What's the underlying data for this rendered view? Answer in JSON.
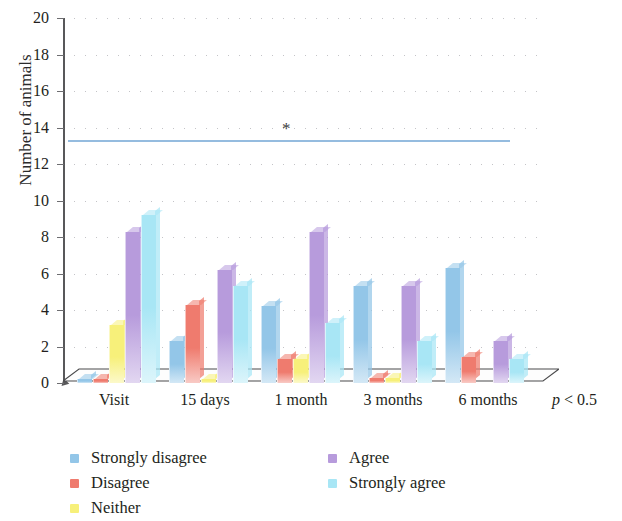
{
  "chart_data": {
    "type": "bar",
    "title": "",
    "subtitle": "",
    "xlabel": "",
    "ylabel": "Number of animals",
    "ylim": [
      0,
      20
    ],
    "ytick_step": 2,
    "yticks": [
      "20",
      "18",
      "16",
      "14",
      "12",
      "10",
      "8",
      "6",
      "4",
      "2",
      "0"
    ],
    "grid": true,
    "grid_style": "dotted-horizontal",
    "legend_position": "bottom-left",
    "categories": [
      "Visit",
      "15 days",
      "1 month",
      "3 months",
      "6 months"
    ],
    "series": [
      {
        "name": "Strongly disagree",
        "color": "#93c6e8",
        "values": [
          0.2,
          2.3,
          4.2,
          5.3,
          6.3
        ]
      },
      {
        "name": "Disagree",
        "color": "#ef7b6e",
        "values": [
          0.2,
          4.3,
          1.3,
          0.3,
          1.4
        ]
      },
      {
        "name": "Neither",
        "color": "#f7f07a",
        "values": [
          3.2,
          0.2,
          1.3,
          0.3,
          0.0
        ]
      },
      {
        "name": "Agree",
        "color": "#b79bdc",
        "values": [
          8.3,
          6.2,
          8.3,
          5.3,
          2.3
        ]
      },
      {
        "name": "Strongly agree",
        "color": "#a8e6f5",
        "values": [
          9.2,
          5.3,
          3.3,
          2.3,
          1.3
        ]
      }
    ],
    "annotations": [
      {
        "type": "significance-line",
        "y": 13.3,
        "x_start_category": "Visit",
        "x_end_category": "6 months",
        "color": "#8fb8dd"
      },
      {
        "type": "asterisk",
        "label": "*",
        "y": 14.2,
        "x_category": "1 month"
      }
    ],
    "footnote": "p < 0.5"
  },
  "axis": {
    "y_title": "Number of animals"
  },
  "footnote": {
    "p_italic": "p",
    "p_rest": " < 0.5"
  },
  "legend": {
    "items": [
      {
        "label": "Strongly disagree",
        "color": "#93c6e8"
      },
      {
        "label": "Disagree",
        "color": "#ef7b6e"
      },
      {
        "label": "Neither",
        "color": "#f7f07a"
      },
      {
        "label": "Agree",
        "color": "#b79bdc"
      },
      {
        "label": "Strongly agree",
        "color": "#a8e6f5"
      }
    ]
  }
}
